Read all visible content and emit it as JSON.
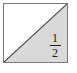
{
  "figure": {
    "name": "half-shaded-square",
    "background_color": "#ffffff",
    "square": {
      "border_color": "#7a7a7a",
      "unshaded_fill": "#ffffff",
      "shaded_fill": "#d9d9d9",
      "diagonal_color": "#4d4d4d",
      "diagonal_from": "bottom-left",
      "diagonal_to": "top-right"
    },
    "fraction": {
      "numerator": "1",
      "denominator": "2",
      "bar": "",
      "text_color": "#1a1a1a",
      "located_in": "shaded-lower-right-triangle"
    }
  }
}
